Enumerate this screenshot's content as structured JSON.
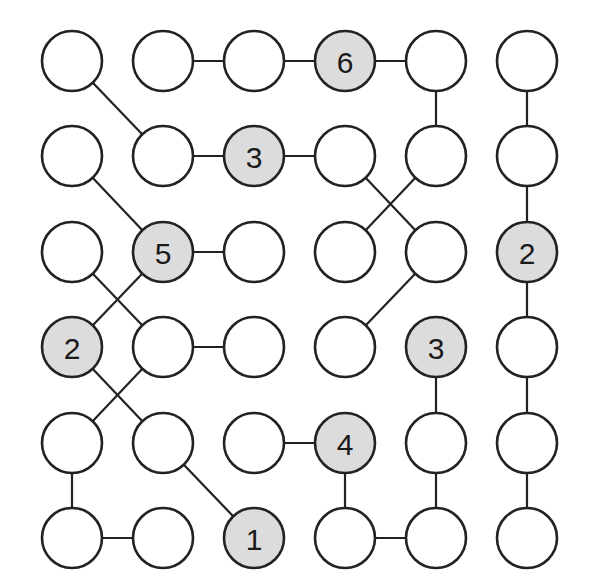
{
  "puzzle": {
    "type": "number-chain-grid",
    "rows": 6,
    "cols": 6,
    "colors": {
      "line": "#222222",
      "given_fill": "#dcdcdc",
      "empty_fill": "#ffffff",
      "text": "#1a1a1a"
    },
    "layout": {
      "col_x": [
        72,
        163,
        254,
        345,
        436,
        527
      ],
      "row_y": [
        61,
        156,
        252,
        347,
        443,
        538
      ],
      "radius": 30
    },
    "cells": [
      [
        null,
        null,
        null,
        "6",
        null,
        null
      ],
      [
        null,
        null,
        "3",
        null,
        null,
        null
      ],
      [
        null,
        "5",
        null,
        null,
        null,
        "2"
      ],
      [
        "2",
        null,
        null,
        null,
        "3",
        null
      ],
      [
        null,
        null,
        null,
        "4",
        null,
        null
      ],
      [
        null,
        null,
        "1",
        null,
        null,
        null
      ]
    ],
    "edges": [
      [
        [
          0,
          1
        ],
        [
          0,
          2
        ]
      ],
      [
        [
          0,
          2
        ],
        [
          0,
          3
        ]
      ],
      [
        [
          0,
          3
        ],
        [
          0,
          4
        ]
      ],
      [
        [
          0,
          0
        ],
        [
          1,
          1
        ]
      ],
      [
        [
          0,
          4
        ],
        [
          1,
          4
        ]
      ],
      [
        [
          0,
          5
        ],
        [
          1,
          5
        ]
      ],
      [
        [
          1,
          5
        ],
        [
          2,
          5
        ]
      ],
      [
        [
          2,
          5
        ],
        [
          3,
          5
        ]
      ],
      [
        [
          3,
          5
        ],
        [
          4,
          5
        ]
      ],
      [
        [
          4,
          5
        ],
        [
          5,
          5
        ]
      ],
      [
        [
          1,
          1
        ],
        [
          1,
          2
        ]
      ],
      [
        [
          1,
          2
        ],
        [
          1,
          3
        ]
      ],
      [
        [
          1,
          3
        ],
        [
          2,
          4
        ]
      ],
      [
        [
          1,
          4
        ],
        [
          2,
          3
        ]
      ],
      [
        [
          1,
          0
        ],
        [
          2,
          1
        ]
      ],
      [
        [
          2,
          1
        ],
        [
          2,
          2
        ]
      ],
      [
        [
          2,
          0
        ],
        [
          3,
          1
        ]
      ],
      [
        [
          2,
          1
        ],
        [
          3,
          0
        ]
      ],
      [
        [
          2,
          4
        ],
        [
          3,
          3
        ]
      ],
      [
        [
          3,
          1
        ],
        [
          3,
          2
        ]
      ],
      [
        [
          3,
          0
        ],
        [
          4,
          1
        ]
      ],
      [
        [
          3,
          1
        ],
        [
          4,
          0
        ]
      ],
      [
        [
          3,
          4
        ],
        [
          4,
          4
        ]
      ],
      [
        [
          4,
          1
        ],
        [
          5,
          2
        ]
      ],
      [
        [
          4,
          2
        ],
        [
          4,
          3
        ]
      ],
      [
        [
          4,
          3
        ],
        [
          5,
          3
        ]
      ],
      [
        [
          4,
          4
        ],
        [
          5,
          4
        ]
      ],
      [
        [
          4,
          0
        ],
        [
          5,
          0
        ]
      ],
      [
        [
          5,
          0
        ],
        [
          5,
          1
        ]
      ],
      [
        [
          5,
          3
        ],
        [
          5,
          4
        ]
      ]
    ]
  }
}
